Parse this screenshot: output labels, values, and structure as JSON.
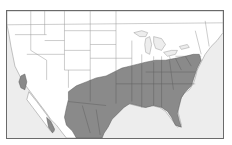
{
  "map": {
    "title": "Species range map",
    "region": "United States and northern Mexico",
    "colors": {
      "ocean": "#ededed",
      "land": "#ffffff",
      "range": "#8a8a8a",
      "range_border": "#5a5a5a",
      "state_lines": "#9a9a9a",
      "frame": "#6a6a6a"
    },
    "layers": [
      {
        "name": "land",
        "description": "North American landmass, white with gray state/province borders"
      },
      {
        "name": "range",
        "description": "Gray shaded distribution: eastern & southern US from Texas/Oklahoma east to the Atlantic, north to Pennsylvania/New Jersey, including Florida; extending south through eastern Mexico; small isolated patch in southern California/Baja"
      }
    ]
  }
}
